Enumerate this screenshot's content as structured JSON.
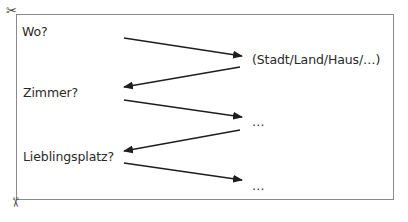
{
  "diagram": {
    "questions": [
      {
        "id": "wo",
        "label": "Wo?"
      },
      {
        "id": "zimmer",
        "label": "Zimmer?"
      },
      {
        "id": "lieblingsplatz",
        "label": "Lieblingsplatz?"
      }
    ],
    "answers": [
      {
        "id": "answer-1",
        "label": "(Stadt/Land/Haus/…)"
      },
      {
        "id": "answer-2",
        "label": "…"
      },
      {
        "id": "answer-3",
        "label": "…"
      }
    ],
    "arrows": [
      {
        "from": [
          124,
          38
        ],
        "to": [
          242,
          56
        ],
        "direction": "right"
      },
      {
        "from": [
          240,
          67
        ],
        "to": [
          124,
          87
        ],
        "direction": "left"
      },
      {
        "from": [
          124,
          100
        ],
        "to": [
          242,
          117
        ],
        "direction": "right"
      },
      {
        "from": [
          240,
          130
        ],
        "to": [
          124,
          151
        ],
        "direction": "left"
      },
      {
        "from": [
          124,
          163
        ],
        "to": [
          242,
          180
        ],
        "direction": "right"
      }
    ],
    "cut_marks": {
      "top_left": "✂",
      "bottom_left": "✂"
    },
    "colors": {
      "border": "#8a8a8a",
      "text": "#2a2a2a",
      "arrow": "#1e1e1e"
    }
  }
}
